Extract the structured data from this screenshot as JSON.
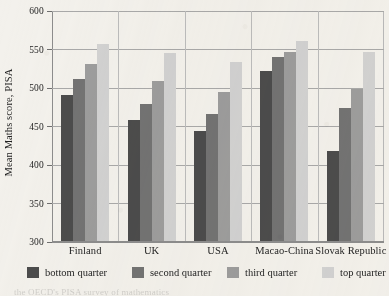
{
  "chart_data": {
    "type": "bar",
    "title": "",
    "subtitle": "",
    "xlabel": "",
    "ylabel": "Mean Maths score, PISA",
    "ylim": [
      300,
      600
    ],
    "yticks": [
      300,
      350,
      400,
      450,
      500,
      550,
      600
    ],
    "ytick_labels": [
      "300",
      "350",
      "400",
      "450",
      "500",
      "550",
      "600"
    ],
    "grid": "horizontal",
    "legend_position": "bottom",
    "categories": [
      "Finland",
      "UK",
      "USA",
      "Macao-China",
      "Slovak Republic"
    ],
    "series": [
      {
        "name": "bottom quarter",
        "color": "#4c4c4c",
        "values": [
          490,
          457,
          443,
          521,
          417
        ]
      },
      {
        "name": "second quarter",
        "color": "#737373",
        "values": [
          510,
          478,
          465,
          539,
          473
        ]
      },
      {
        "name": "third quarter",
        "color": "#9d9d9d",
        "values": [
          530,
          508,
          494,
          546,
          497
        ]
      },
      {
        "name": "top quarter",
        "color": "#d2d2d2",
        "values": [
          556,
          544,
          533,
          560,
          545
        ]
      }
    ]
  },
  "footnote": {
    "text_cutoff": "the OECD's PISA survey of mathematics"
  }
}
